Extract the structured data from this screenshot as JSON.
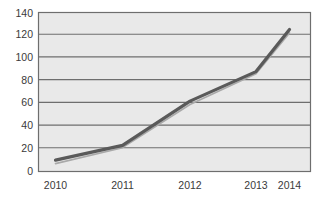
{
  "chart_data": {
    "type": "line",
    "title": "",
    "subtitle": "",
    "xlabel": "",
    "ylabel": "",
    "categories": [
      "2010",
      "2011",
      "2012",
      "2013",
      "2014"
    ],
    "x": [
      2010,
      2011,
      2012,
      2013,
      2014
    ],
    "series": [
      {
        "name": "primary",
        "color": "#5a5a5a",
        "values": [
          10,
          23,
          62,
          88,
          125
        ]
      },
      {
        "name": "secondary",
        "color": "#a9a9a9",
        "values": [
          7,
          21,
          59,
          86,
          122
        ]
      }
    ],
    "ylim": [
      0,
      140
    ],
    "yticks": [
      0,
      20,
      40,
      60,
      80,
      100,
      120,
      140
    ],
    "ytick_labels": [
      "0",
      "20",
      "40",
      "60",
      "80",
      "100",
      "120",
      "140"
    ],
    "xtick_labels": [
      "2010",
      "2011",
      "2012",
      "2013",
      "2014"
    ],
    "grid": true,
    "grid_axis": "y",
    "legend": false,
    "legend_position": "none",
    "plot_background": "#e9e9e9",
    "figure_background": "#ffffff",
    "axis_color": "#6e6e6e",
    "tick_text_color": "#3a3a3a",
    "annotations": []
  },
  "labels": {
    "y": {
      "t0": "0",
      "t1": "20",
      "t2": "40",
      "t3": "60",
      "t4": "80",
      "t5": "100",
      "t6": "120",
      "t7": "140"
    },
    "x": {
      "t0": "2010",
      "t1": "2011",
      "t2": "2012",
      "t3": "2013",
      "t4": "2014"
    }
  }
}
